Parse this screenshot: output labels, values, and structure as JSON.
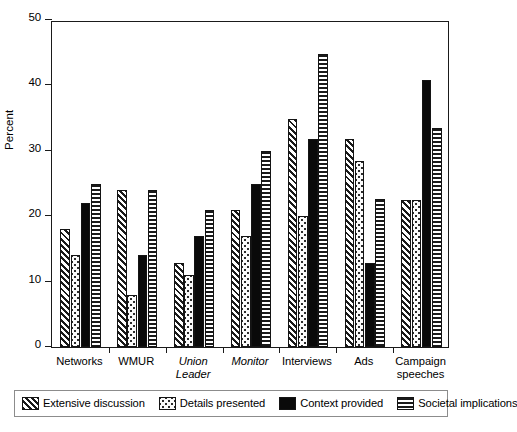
{
  "chart_data": {
    "type": "bar",
    "title": "",
    "xlabel": "",
    "ylabel": "Percent",
    "ylim": [
      0,
      50
    ],
    "yticks": [
      0,
      10,
      20,
      30,
      40,
      50
    ],
    "grid": false,
    "legend_position": "bottom",
    "categories": [
      "Networks",
      "WMUR",
      "Union Leader",
      "Monitor",
      "Interviews",
      "Ads",
      "Campaign speeches"
    ],
    "category_styles": [
      "normal",
      "normal",
      "italic",
      "italic",
      "normal",
      "normal",
      "normal"
    ],
    "category_lines": [
      [
        "Networks"
      ],
      [
        "WMUR"
      ],
      [
        "Union",
        "Leader"
      ],
      [
        "Monitor"
      ],
      [
        "Interviews"
      ],
      [
        "Ads"
      ],
      [
        "Campaign",
        "speeches"
      ]
    ],
    "series": [
      {
        "name": "Extensive discussion",
        "pattern": "diagonal-hatch",
        "values": [
          18.0,
          24.0,
          12.8,
          21.0,
          34.8,
          31.8,
          22.5
        ]
      },
      {
        "name": "Details presented",
        "pattern": "dots",
        "values": [
          14.0,
          8.0,
          11.0,
          17.0,
          20.0,
          28.5,
          22.5
        ]
      },
      {
        "name": "Context provided",
        "pattern": "solid-black",
        "values": [
          22.0,
          14.0,
          17.0,
          25.0,
          31.8,
          12.8,
          40.8
        ]
      },
      {
        "name": "Societal implications",
        "pattern": "horizontal-lines",
        "values": [
          25.0,
          24.0,
          21.0,
          30.0,
          44.8,
          22.7,
          33.5
        ]
      }
    ]
  }
}
